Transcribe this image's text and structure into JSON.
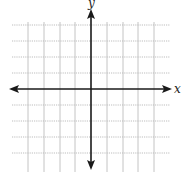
{
  "diagram": {
    "type": "coordinate-plane",
    "x_axis_label": "x",
    "y_axis_label": "y",
    "grid": {
      "vertical_lines_x": [
        28,
        44,
        60,
        75,
        107,
        123,
        138,
        154
      ],
      "horizontal_lines_y": [
        25,
        41,
        57,
        73,
        105,
        121,
        137,
        153
      ],
      "x_extent": [
        12,
        170
      ],
      "y_extent": [
        10,
        172
      ],
      "style": "dotted",
      "color": "#bdbdbd"
    },
    "axes": {
      "origin": [
        91,
        89
      ],
      "x_range_px": [
        10,
        172
      ],
      "y_range_px": [
        10,
        170
      ],
      "color": "#1a1a1a",
      "arrows": "both-ends"
    },
    "grid_units": {
      "x": [
        -4,
        4
      ],
      "y": [
        -4,
        4
      ]
    }
  }
}
